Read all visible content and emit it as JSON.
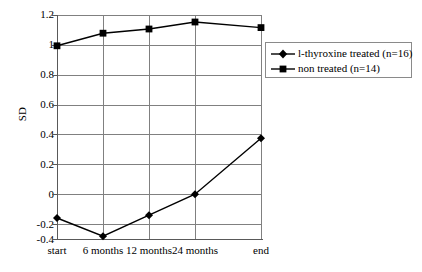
{
  "chart_data": {
    "type": "line",
    "title": "",
    "subtitle": "",
    "xlabel": "",
    "ylabel": "SD",
    "categories": [
      "start",
      "6 months",
      "12 months",
      "24 months",
      "end"
    ],
    "ylim": [
      -0.4,
      1.2
    ],
    "yticks": [
      1.2,
      1,
      0.8,
      0.6,
      0.4,
      0.2,
      0,
      -0.2,
      -0.4
    ],
    "ytick_labels": [
      "1.2",
      "1",
      "0.8",
      "0.6",
      "0.4",
      "0.2",
      "0",
      "-0.2",
      "-0.4"
    ],
    "grid": "both",
    "legend_position": "upper-right-inside",
    "series": [
      {
        "name": "l-thyroxine treated (n=16)",
        "marker": "diamond",
        "color": "#000000",
        "values": [
          -0.25,
          -0.38,
          -0.23,
          -0.08,
          0.32
        ]
      },
      {
        "name": "non treated (n=14)",
        "marker": "square",
        "color": "#000000",
        "values": [
          0.98,
          1.07,
          1.1,
          1.15,
          1.11
        ]
      }
    ]
  },
  "axis": {
    "y_title": "SD",
    "y_tick_0": "1.2",
    "y_tick_1": "1",
    "y_tick_2": "0.8",
    "y_tick_3": "0.6",
    "y_tick_4": "0.4",
    "y_tick_5": "0.2",
    "y_tick_6": "0",
    "y_tick_7": "-0.2",
    "y_tick_8": "-0.4",
    "x_tick_0": "start",
    "x_tick_1": "6 months",
    "x_tick_2": "12 months",
    "x_tick_3": "24 months",
    "x_tick_4": "end"
  },
  "legend": {
    "entries": [
      {
        "label": "l-thyroxine treated (n=16)",
        "marker": "diamond-marker"
      },
      {
        "label": "non treated (n=14)",
        "marker": "square-marker"
      }
    ]
  }
}
